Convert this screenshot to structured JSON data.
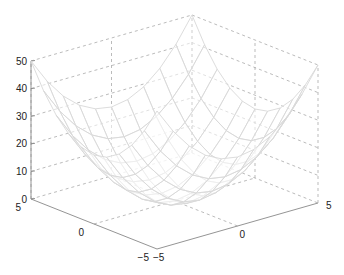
{
  "chart_data": {
    "type": "surface",
    "title": "",
    "function": "z = x^2 + y^2",
    "x": [
      -5,
      -4,
      -3,
      -2,
      -1,
      0,
      1,
      2,
      3,
      4,
      5
    ],
    "y": [
      -5,
      -4,
      -3,
      -2,
      -1,
      0,
      1,
      2,
      3,
      4,
      5
    ],
    "xlim": [
      -5,
      5
    ],
    "ylim": [
      -5,
      5
    ],
    "zlim": [
      0,
      50
    ],
    "z_ticks": [
      "0",
      "10",
      "20",
      "30",
      "40",
      "50"
    ],
    "x_ticks": [
      "-5",
      "0",
      "5"
    ],
    "y_ticks": [
      "-5",
      "0",
      "5"
    ],
    "xlabel": "",
    "ylabel": "",
    "zlabel": "",
    "grid": true,
    "grid_style": "dashed",
    "mesh_color": "#d8d8d8",
    "colors": {
      "axis": "#888888",
      "grid": "#aaaaaa",
      "text": "#222222"
    }
  }
}
